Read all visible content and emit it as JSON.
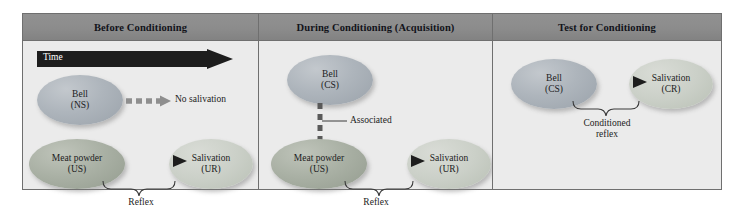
{
  "figure": {
    "kind": "classical-conditioning-diagram",
    "colors": {
      "frame_border": "#6f6f6f",
      "header_bar": "#8c8c8c",
      "panel_background": "#ebebeb",
      "page_background": "#ffffff",
      "ellipse_bell": "#a9b1b9",
      "ellipse_meat_powder": "#a6ada1",
      "ellipse_salivation": "#c9cfc6",
      "arrow_dark": "#2a2a2a",
      "dashed_arrow": "#8e8e8e",
      "time_arrow": "#1d1d1d",
      "text": "#1b1c22",
      "time_label_text": "#ffffff"
    },
    "panels": [
      {
        "id": "before-conditioning",
        "title": "Before Conditioning",
        "time_arrow": {
          "label": "Time",
          "direction": "right"
        },
        "nodes": [
          {
            "id": "bell-ns",
            "line1": "Bell",
            "line2": "(NS)",
            "style": "ellipse-blue"
          },
          {
            "id": "no-salivation",
            "text": "No salivation",
            "style": "plain-text"
          },
          {
            "id": "meat-powder-us",
            "line1": "Meat powder",
            "line2": "(US)",
            "style": "ellipse-green"
          },
          {
            "id": "salivation-ur",
            "line1": "Salivation",
            "line2": "(UR)",
            "style": "ellipse-light"
          }
        ],
        "arrows": [
          {
            "id": "bell-to-no-salivation",
            "style": "dashed",
            "from": "bell-ns",
            "to": "no-salivation"
          },
          {
            "id": "meat-to-salivation",
            "style": "solid",
            "from": "meat-powder-us",
            "to": "salivation-ur"
          }
        ],
        "brace_label": "Reflex"
      },
      {
        "id": "during-conditioning",
        "title": "During Conditioning (Acquisition)",
        "nodes": [
          {
            "id": "bell-cs",
            "line1": "Bell",
            "line2": "(CS)",
            "style": "ellipse-blue"
          },
          {
            "id": "meat-powder-us",
            "line1": "Meat powder",
            "line2": "(US)",
            "style": "ellipse-green"
          },
          {
            "id": "salivation-ur",
            "line1": "Salivation",
            "line2": "(UR)",
            "style": "ellipse-light"
          }
        ],
        "association_label": "Associated",
        "arrows": [
          {
            "id": "meat-to-salivation",
            "style": "solid",
            "from": "meat-powder-us",
            "to": "salivation-ur"
          }
        ],
        "brace_label": "Reflex"
      },
      {
        "id": "test-for-conditioning",
        "title": "Test for Conditioning",
        "nodes": [
          {
            "id": "bell-cs",
            "line1": "Bell",
            "line2": "(CS)",
            "style": "ellipse-blue"
          },
          {
            "id": "salivation-cr",
            "line1": "Salivation",
            "line2": "(CR)",
            "style": "ellipse-light"
          }
        ],
        "arrows": [
          {
            "id": "bell-to-salivation",
            "style": "solid",
            "from": "bell-cs",
            "to": "salivation-cr"
          }
        ],
        "brace_label_line1": "Conditioned",
        "brace_label_line2": "reflex"
      }
    ]
  }
}
